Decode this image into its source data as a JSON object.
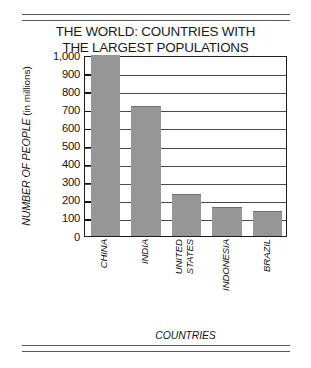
{
  "chart_data": {
    "type": "bar",
    "title": "THE WORLD: COUNTRIES WITH\nTHE LARGEST POPULATIONS",
    "xlabel": "COUNTRIES",
    "ylabel_italic": "NUMBER OF PEOPLE",
    "ylabel_upright": " (in millions)",
    "ylabel_full": "NUMBER OF PEOPLE (in millions)",
    "categories": [
      "CHINA",
      "INDIA",
      "UNITED\nSTATES",
      "INDONESIA",
      "BRAZIL"
    ],
    "values": [
      1020,
      720,
      230,
      160,
      140
    ],
    "ylim": [
      0,
      1000
    ],
    "ytick_labels": [
      "1,000",
      "900",
      "800",
      "700",
      "600",
      "500",
      "400",
      "300",
      "200",
      "100",
      "0"
    ],
    "ytick_values": [
      1000,
      900,
      800,
      700,
      600,
      500,
      400,
      300,
      200,
      100,
      0
    ],
    "ytick_step": 100,
    "grid": true,
    "legend": "none",
    "bar_color": "#969696",
    "axis_color": "#1c1c1c",
    "grid_color": "#4a4a4a",
    "background": "#ffffff",
    "rule_color": "#5a5a5a"
  }
}
